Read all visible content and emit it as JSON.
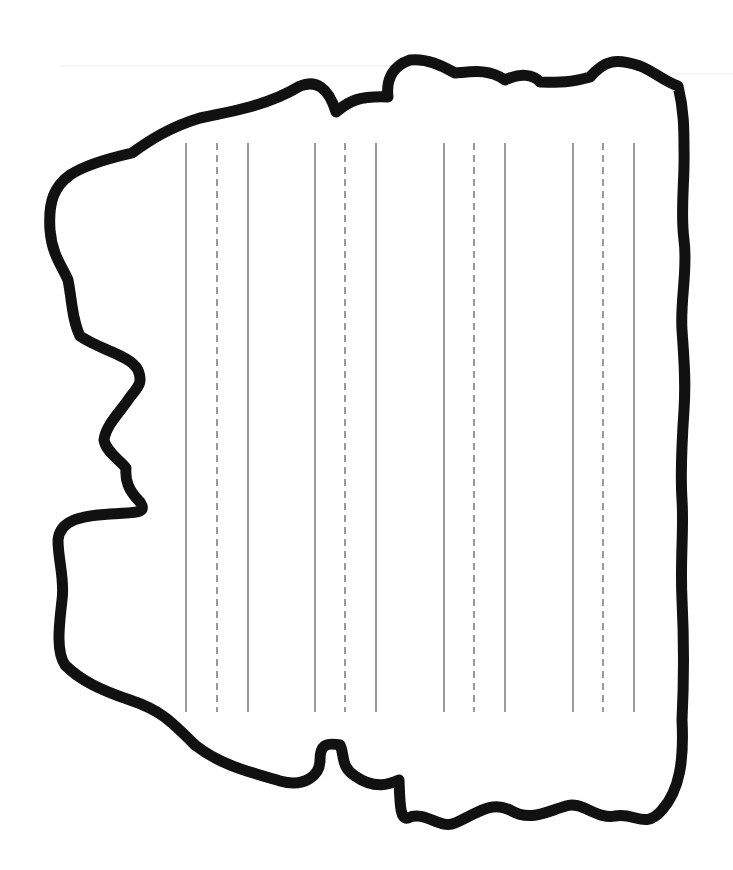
{
  "worksheet": {
    "type": "handwriting-practice-sheet",
    "canvas": {
      "width": 733,
      "height": 870,
      "background": "#ffffff"
    },
    "outline": {
      "stroke": "#111111",
      "stroke_width": 11,
      "path": "M 132 153 C 150 140 170 127 200 118 C 240 110 270 104 300 86 C 315 80 328 86 336 112 C 350 100 360 96 388 97 C 386 80 392 66 410 60 C 425 58 440 64 455 73 C 470 72 488 68 505 80 C 520 73 533 74 540 82 C 555 82 565 84 590 77 C 605 60 616 58 640 66 C 655 72 665 82 678 86 C 684 110 684 130 684 150 C 685 180 680 210 684 240 C 688 270 680 300 682 330 C 684 360 686 380 684 410 C 682 440 680 470 682 500 C 684 530 680 560 682 600 C 684 640 684 680 682 720 C 684 760 680 790 662 810 C 645 830 635 812 615 816 C 598 820 580 800 566 806 C 545 812 530 822 510 810 C 490 800 475 815 455 823 C 440 830 425 810 408 818 C 400 820 400 805 399 780 C 390 784 375 790 355 776 C 340 766 345 755 340 745 C 325 742 320 746 320 760 C 320 775 305 788 280 781 C 250 772 220 765 195 745 C 170 720 160 710 130 700 C 100 690 80 680 65 665 C 55 650 60 620 62 600 C 65 580 58 560 58 540 C 60 520 80 516 110 514 C 135 512 148 514 140 502 C 128 490 125 480 126 468 C 120 460 106 452 104 440 C 106 425 120 412 128 400 C 136 388 144 385 138 370 C 130 355 100 350 80 336 C 72 320 72 300 68 280 C 62 266 52 255 50 230 C 48 200 55 186 70 175 C 85 165 110 158 132 153 Z"
    },
    "faint_scan_lines": [
      {
        "x1": 60,
        "y1": 66,
        "x2": 400,
        "y2": 66
      },
      {
        "x1": 640,
        "y1": 74,
        "x2": 733,
        "y2": 74
      }
    ],
    "guide_lines": {
      "color": "#9a9a9a",
      "stroke_width": 2,
      "y_start": 143,
      "y_end": 712,
      "dash": "7 5",
      "groups": [
        {
          "solid_a": 186,
          "dashed": 217,
          "solid_b": 248
        },
        {
          "solid_a": 315,
          "dashed": 345,
          "solid_b": 376
        },
        {
          "solid_a": 444,
          "dashed": 474,
          "solid_b": 505
        },
        {
          "solid_a": 573,
          "dashed": 603,
          "solid_b": 634
        }
      ]
    }
  }
}
